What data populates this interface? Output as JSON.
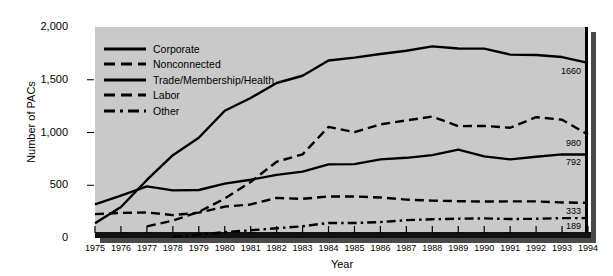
{
  "chart_data": {
    "type": "line",
    "title": "",
    "xlabel": "Year",
    "ylabel": "Number of PACs",
    "grid": false,
    "legend_position": "upper-left-inside",
    "xlim": [
      1975,
      1994
    ],
    "ylim": [
      0,
      2000
    ],
    "yticks": [
      0,
      500,
      1000,
      1500,
      2000
    ],
    "ytick_labels": [
      "0",
      "500",
      "1,000",
      "1,500",
      "2,000"
    ],
    "x": [
      1975,
      1976,
      1977,
      1978,
      1979,
      1980,
      1981,
      1982,
      1983,
      1984,
      1985,
      1986,
      1987,
      1988,
      1989,
      1990,
      1991,
      1992,
      1993,
      1994
    ],
    "xtick_labels": [
      "1975",
      "1976",
      "1977",
      "1978",
      "1979",
      "1980",
      "1981",
      "1982",
      "1983",
      "1984",
      "1985",
      "1986",
      "1987",
      "1988",
      "1989",
      "1990",
      "1991",
      "1992",
      "1993",
      "1994"
    ],
    "series": [
      {
        "name": "Corporate",
        "style": "solid",
        "end_label": "1660",
        "values": [
          139,
          294,
          550,
          785,
          950,
          1206,
          1327,
          1469,
          1538,
          1682,
          1710,
          1744,
          1775,
          1816,
          1796,
          1795,
          1738,
          1735,
          1715,
          1660
        ]
      },
      {
        "name": "Nonconnected",
        "style": "dashed",
        "end_label": "980",
        "values": [
          null,
          null,
          110,
          165,
          247,
          374,
          531,
          723,
          793,
          1053,
          1003,
          1077,
          1115,
          1151,
          1060,
          1062,
          1045,
          1145,
          1121,
          980
        ]
      },
      {
        "name": "Trade/Membership/Health",
        "style": "solid",
        "end_label": "792",
        "values": [
          318,
          402,
          489,
          451,
          455,
          515,
          552,
          598,
          629,
          698,
          700,
          745,
          760,
          786,
          838,
          774,
          745,
          770,
          793,
          792
        ]
      },
      {
        "name": "Labor",
        "style": "dashed",
        "end_label": "333",
        "values": [
          226,
          238,
          242,
          217,
          240,
          297,
          318,
          380,
          371,
          394,
          394,
          384,
          364,
          354,
          349,
          346,
          347,
          347,
          337,
          333
        ]
      },
      {
        "name": "Other",
        "style": "dashdot",
        "end_label": "189",
        "values": [
          null,
          null,
          null,
          12,
          30,
          56,
          73,
          92,
          111,
          143,
          142,
          151,
          169,
          178,
          183,
          186,
          180,
          182,
          188,
          189
        ]
      }
    ]
  },
  "axes": {
    "y_title": "Number of PACs",
    "x_title": "Year"
  },
  "colors": {
    "panel_background": "#c9c9c9",
    "line": "#000000",
    "shadow": "#4a4a4a",
    "figure_background": "#ffffff"
  }
}
